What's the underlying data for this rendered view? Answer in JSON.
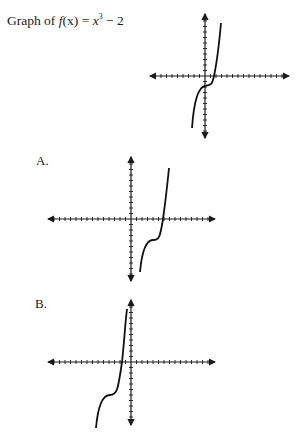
{
  "title": {
    "prefix": "Graph of ",
    "func": "f",
    "arg": "(x)",
    "eq": " = ",
    "var": "x",
    "exp": "3",
    "rest": " − 2"
  },
  "options": [
    {
      "label": "A."
    },
    {
      "label": "B."
    }
  ],
  "chart_data": [
    {
      "type": "line",
      "title": "Graph of f(x) = x^3 − 2",
      "function": "x^3 - 2",
      "axes": {
        "x_ticks": "unlabeled, unit spacing",
        "y_ticks": "unlabeled, unit spacing",
        "arrows": true
      },
      "inflection_point": [
        0,
        -2
      ],
      "x_intercept": 1.26
    },
    {
      "type": "line",
      "title": "A.",
      "description": "cubic curve shifted right; inflection in quadrant IV",
      "inflection_point": [
        2,
        -2
      ],
      "axes": {
        "arrows": true
      }
    },
    {
      "type": "line",
      "title": "B.",
      "description": "cubic curve shifted left and down; inflection in quadrant III",
      "inflection_point": [
        -2,
        -3
      ],
      "axes": {
        "arrows": true
      }
    }
  ]
}
